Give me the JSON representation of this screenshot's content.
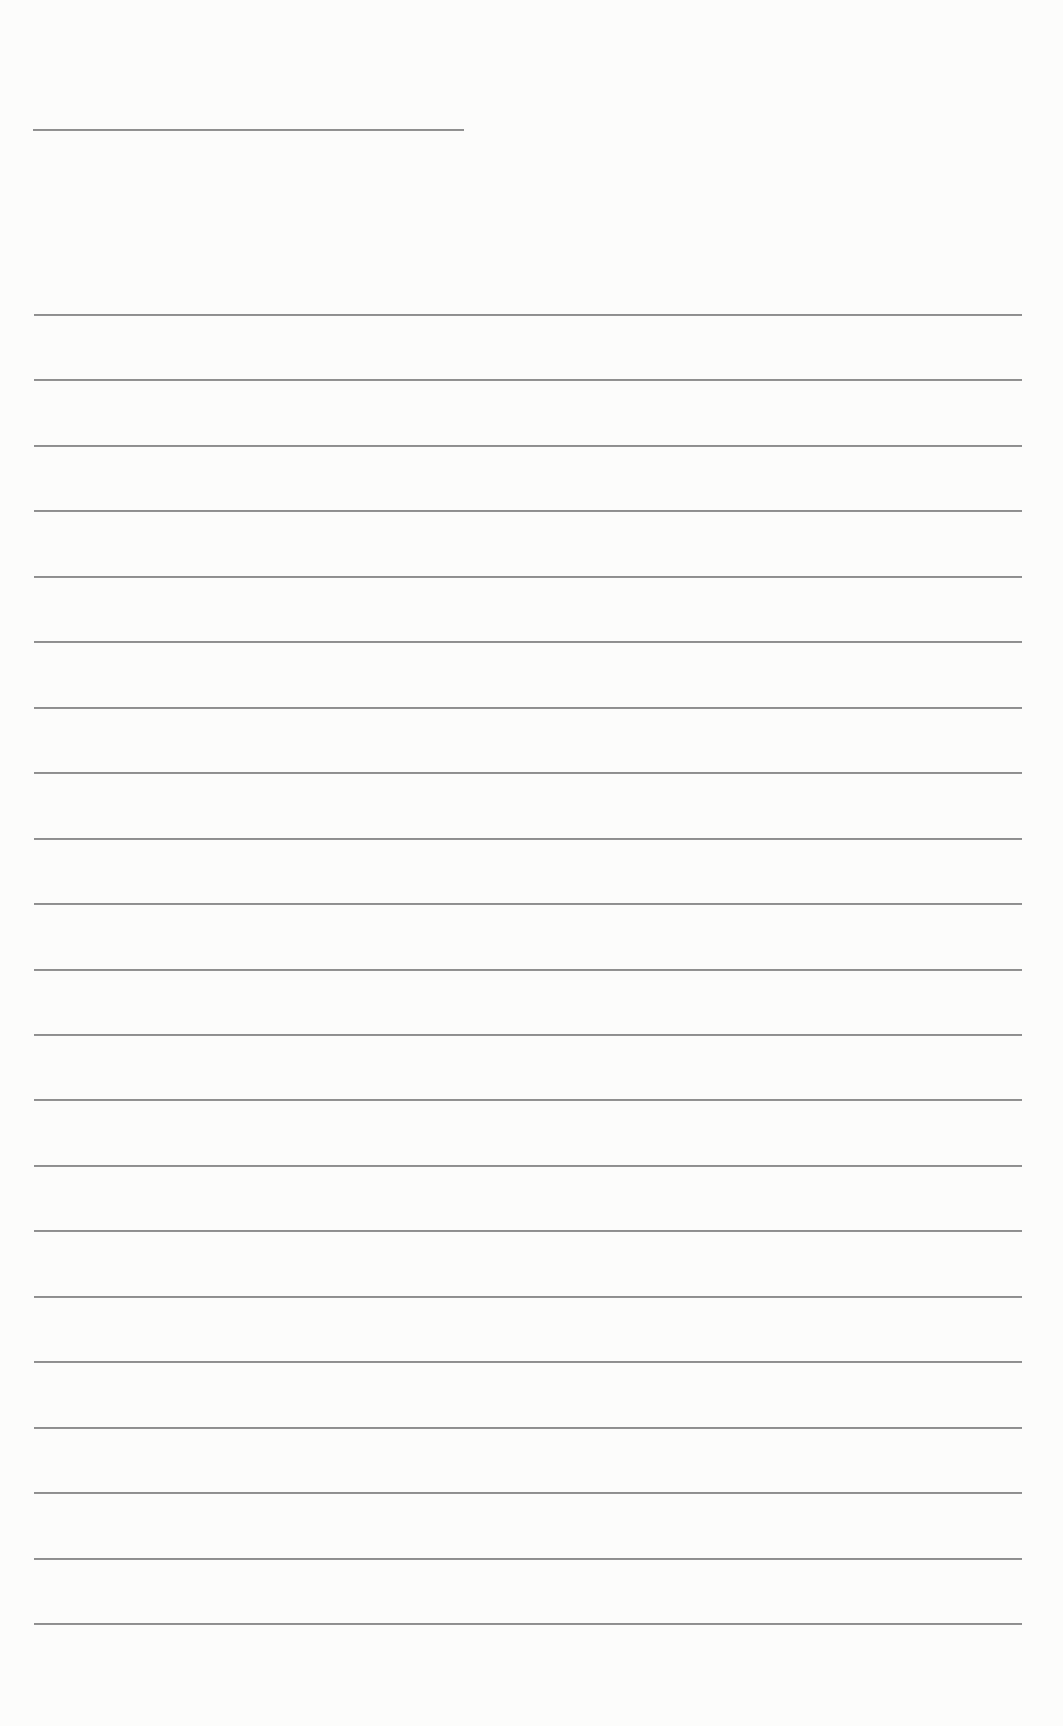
{
  "document": {
    "type": "lined writing sheet",
    "background_color": "#fcfcfb",
    "rule_color": "#8e8e8e",
    "header_line": {
      "x1": 33,
      "x2": 464,
      "y": 129
    },
    "writing_lines": {
      "count": 21,
      "x1": 34,
      "x2": 1022,
      "first_y": 314,
      "last_y": 1623,
      "spacing": 65.45
    }
  }
}
